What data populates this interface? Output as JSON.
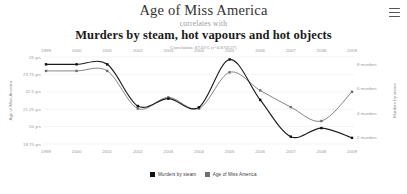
{
  "header": {
    "title_top": "Age of Miss America",
    "connector": "correlates with",
    "title_bottom": "Murders by steam, hot vapours and hot objects",
    "correlation": "Correlation: 87.01% (r=0.870127)"
  },
  "menu": {
    "icon": "hamburger-menu-icon",
    "label": "Menu"
  },
  "legend": {
    "items": [
      {
        "label": "Murders by steam",
        "color": "#111111",
        "marker": "square-marker"
      },
      {
        "label": "Age of Miss America",
        "color": "#6f6f6f",
        "marker": "square-marker"
      }
    ]
  },
  "chart_data": {
    "type": "line",
    "title": "Age of Miss America correlates with Murders by steam, hot vapours and hot objects",
    "subtitle": "Correlation: 87.01% (r=0.870127)",
    "xlabel": "",
    "grid": true,
    "legend_position": "bottom",
    "x": [
      1999,
      2000,
      2001,
      2002,
      2003,
      2004,
      2005,
      2006,
      2007,
      2008,
      2009
    ],
    "x_axis_top_ticks": [
      "1999",
      "2000",
      "2001",
      "2002",
      "2003",
      "2004",
      "2005",
      "2006",
      "2007",
      "2008",
      "2009"
    ],
    "x_axis_bottom_ticks": [
      "1999",
      "2000",
      "2001",
      "2002",
      "2003",
      "2004",
      "2005",
      "2006",
      "2007",
      "2008",
      "2009"
    ],
    "axes": [
      {
        "id": "left",
        "name": "Age of Miss America",
        "ylabel": "Age of Miss America",
        "ticks": [
          "25 yrs",
          "23.75 yrs",
          "22.5 yrs",
          "21.25 yrs",
          "20 yrs",
          "18.75 yrs"
        ],
        "tick_values": [
          25,
          23.75,
          22.5,
          21.25,
          20,
          18.75
        ],
        "ylim": [
          18.75,
          25
        ]
      },
      {
        "id": "right",
        "name": "Murders by steam",
        "ylabel": "Murders by steam",
        "ticks": [
          "8 murders",
          "6 murders",
          "4 murders",
          "2 murders"
        ],
        "tick_values": [
          8,
          6,
          4,
          2
        ],
        "ylim": [
          1.5,
          8.6
        ]
      }
    ],
    "series": [
      {
        "name": "Age of Miss America",
        "axis": "left",
        "color": "#6f6f6f",
        "unit": "yrs",
        "values": [
          24,
          24,
          24,
          21.3,
          22.1,
          21.3,
          23.9,
          22.6,
          21.4,
          20.4,
          22.5
        ]
      },
      {
        "name": "Murders by steam",
        "axis": "right",
        "color": "#111111",
        "unit": "murders",
        "values": [
          8,
          8,
          8,
          4.6,
          5.2,
          4.5,
          8.4,
          5.1,
          2.1,
          2.8,
          2.0
        ]
      }
    ]
  }
}
